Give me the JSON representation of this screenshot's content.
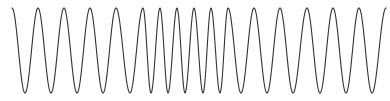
{
  "chart_data": {
    "type": "line",
    "title": "",
    "xlabel": "",
    "ylabel": "",
    "grid": false,
    "legend": false,
    "axes_visible": false,
    "line_color": "#333333",
    "line_width": 1.1,
    "y_top": 8,
    "y_bottom": 93,
    "extrema": [
      {
        "x": 12,
        "type": "peak"
      },
      {
        "x": 25,
        "type": "trough"
      },
      {
        "x": 38,
        "type": "peak"
      },
      {
        "x": 51,
        "type": "trough"
      },
      {
        "x": 64,
        "type": "peak"
      },
      {
        "x": 77,
        "type": "trough"
      },
      {
        "x": 90,
        "type": "peak"
      },
      {
        "x": 103,
        "type": "trough"
      },
      {
        "x": 116,
        "type": "peak"
      },
      {
        "x": 130,
        "type": "trough"
      },
      {
        "x": 143,
        "type": "peak"
      },
      {
        "x": 151,
        "type": "trough"
      },
      {
        "x": 160,
        "type": "peak"
      },
      {
        "x": 168,
        "type": "trough"
      },
      {
        "x": 177,
        "type": "peak"
      },
      {
        "x": 185,
        "type": "trough"
      },
      {
        "x": 194,
        "type": "peak"
      },
      {
        "x": 203,
        "type": "trough"
      },
      {
        "x": 211,
        "type": "peak"
      },
      {
        "x": 220,
        "type": "trough"
      },
      {
        "x": 228,
        "type": "peak"
      },
      {
        "x": 241,
        "type": "trough"
      },
      {
        "x": 254,
        "type": "peak"
      },
      {
        "x": 267,
        "type": "trough"
      },
      {
        "x": 280,
        "type": "peak"
      },
      {
        "x": 293,
        "type": "trough"
      },
      {
        "x": 307,
        "type": "peak"
      },
      {
        "x": 320,
        "type": "trough"
      },
      {
        "x": 333,
        "type": "peak"
      },
      {
        "x": 346,
        "type": "trough"
      },
      {
        "x": 359,
        "type": "peak"
      },
      {
        "x": 372,
        "type": "trough"
      },
      {
        "x": 386,
        "type": "peak"
      }
    ]
  }
}
